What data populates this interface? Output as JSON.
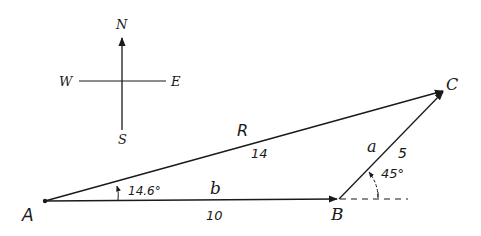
{
  "diagram": {
    "type": "vector-addition",
    "stroke_color": "#1a1a1a",
    "background": "#ffffff",
    "compass": {
      "north": "N",
      "south": "S",
      "east": "E",
      "west": "W"
    },
    "points": {
      "A": "A",
      "B": "B",
      "C": "C"
    },
    "vectors": {
      "resultant": {
        "label": "R",
        "magnitude": "14"
      },
      "b": {
        "label": "b",
        "magnitude": "10"
      },
      "a": {
        "label": "a",
        "magnitude": "5"
      }
    },
    "angles": {
      "at_A": "14.6°",
      "at_B": "45°"
    }
  }
}
